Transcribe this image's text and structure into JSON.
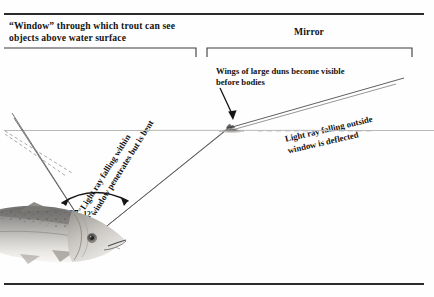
{
  "figure": {
    "title_left": "“Window” through which trout can see objects above water surface",
    "title_right": "Mirror",
    "labels": {
      "duns": "Wings of large duns become visible before bodies",
      "ray_within": "Light ray falling within",
      "ray_within_2": "window penetrates but is bent",
      "ray_outside": "Light ray falling outside",
      "ray_outside_2": "window is deflected",
      "angle_degrees": "97",
      "angle_degree_symbol": "°",
      "angle_minutes": "12′"
    },
    "icons": {
      "trout": "trout-fish-photo",
      "mayfly": "mayfly-dun-insect",
      "pointer": "arrow-pointer-icon",
      "angle_arc": "angle-arc-icon",
      "bracket_left": "span-bracket-window",
      "bracket_right": "span-bracket-mirror"
    },
    "colors": {
      "ink": "#141414",
      "rule": "#2b2b2b",
      "ray": "#4a4a4a",
      "water": "#b9b9b9"
    }
  }
}
